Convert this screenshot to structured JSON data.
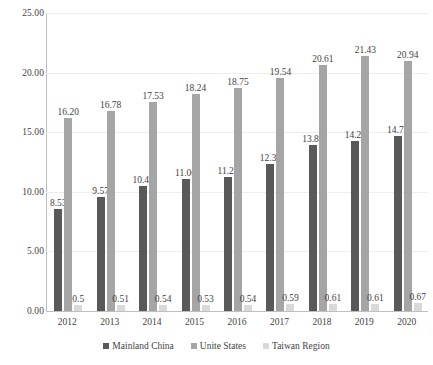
{
  "chart_data": {
    "type": "bar",
    "title": "",
    "subtitle": "",
    "xlabel": "",
    "ylabel": "",
    "categories": [
      "2012",
      "2013",
      "2014",
      "2015",
      "2016",
      "2017",
      "2018",
      "2019",
      "2020"
    ],
    "series": [
      {
        "name": "Mainland China",
        "color": "#595959",
        "values": [
          8.53,
          9.57,
          10.48,
          11.06,
          11.23,
          12.31,
          13.89,
          14.28,
          14.72
        ],
        "labels": [
          "8.53",
          "9.57",
          "10.48",
          "11.06",
          "11.23",
          "12.31",
          "13.89",
          "14.28",
          "14.72"
        ]
      },
      {
        "name": "Unite States",
        "color": "#a5a5a5",
        "values": [
          16.2,
          16.78,
          17.53,
          18.24,
          18.75,
          19.54,
          20.61,
          21.43,
          20.94
        ],
        "labels": [
          "16.20",
          "16.78",
          "17.53",
          "18.24",
          "18.75",
          "19.54",
          "20.61",
          "21.43",
          "20.94"
        ]
      },
      {
        "name": "Taiwan Region",
        "color": "#d9d9d9",
        "values": [
          0.5,
          0.51,
          0.54,
          0.53,
          0.54,
          0.59,
          0.61,
          0.61,
          0.67
        ],
        "labels": [
          "0.5",
          "0.51",
          "0.54",
          "0.53",
          "0.54",
          "0.59",
          "0.61",
          "0.61",
          "0.67"
        ]
      }
    ],
    "ylim": [
      0,
      25
    ],
    "ytick_values": [
      0,
      5,
      10,
      15,
      20,
      25
    ],
    "ytick_labels": [
      "0.00",
      "5.00",
      "10.00",
      "15.00",
      "20.00",
      "25.00"
    ],
    "grid": true,
    "grid_color": "#ededed",
    "legend_position": "bottom",
    "axis_color": "#bfbfbf"
  }
}
